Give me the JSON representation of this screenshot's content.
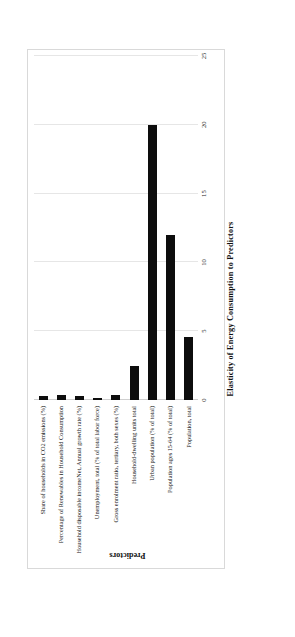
{
  "document": {
    "caption": "Figure 10-4. Results of the elasticity analysis for Denmark."
  },
  "chart_data": {
    "type": "bar",
    "orientation": "horizontal",
    "title": "",
    "xlabel": "Elasticity of Energy Consumption  to Predictors",
    "ylabel": "Predictors",
    "xlim": [
      0,
      25
    ],
    "xticks": [
      "0",
      "5",
      "10",
      "15",
      "20",
      "25"
    ],
    "xtick_values": [
      0,
      5,
      10,
      15,
      20,
      25
    ],
    "grid": true,
    "legend": "none",
    "bar_color": "#0d0d0d",
    "categories": [
      "Share of households in CO2 emissions (%)",
      "Percentage of Renewables in Household Consumption",
      "Household disposable incomeNet, Annual growth rate (%)",
      "Unemployment, total (% of total labor force)",
      "Gross enrolment ratio, tertiary, both sexes (%)",
      "Household-dwelling units total",
      "Urban population (% of total)",
      "Population ages 15-64 (% of total)",
      "Population, total"
    ],
    "values": [
      0.3,
      0.35,
      0.3,
      0.12,
      0.35,
      2.5,
      20.0,
      12.0,
      4.6
    ]
  }
}
